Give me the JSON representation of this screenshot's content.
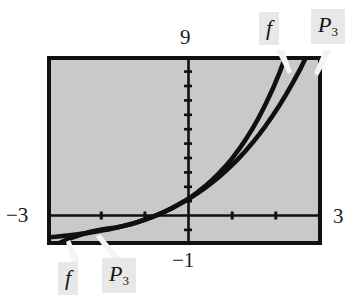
{
  "figure": {
    "type": "graphing-calculator-plot",
    "background_color": "#ffffff",
    "plot_fill_color": "#c9c9c9",
    "frame_color": "#111111",
    "curve_color": "#101010",
    "label_box_color": "#e8e8e8"
  },
  "axis_labels": {
    "y_max": "9",
    "y_min": "−3",
    "x_min": "−1",
    "x_max": "3"
  },
  "curve_labels": {
    "f_top": "f",
    "p3_top_base": "P",
    "p3_top_sub": "3",
    "f_bottom": "f",
    "p3_bottom_base": "P",
    "p3_bottom_sub": "3"
  },
  "chart_data": {
    "type": "line",
    "title": "",
    "subtitle": "",
    "xlabel": "",
    "ylabel": "",
    "xlim": [
      -1,
      3
    ],
    "ylim": [
      -3,
      9
    ],
    "grid": false,
    "legend": "inline-annotations",
    "x_ticks": [
      -1,
      0,
      1,
      2,
      3
    ],
    "y_ticks": [
      -3,
      -2,
      -1,
      0,
      1,
      2,
      3,
      4,
      5,
      6,
      7,
      8,
      9
    ],
    "x_tick_labels": [
      "−1",
      "",
      "",
      "",
      "3"
    ],
    "y_tick_labels": [
      "−3",
      "",
      "",
      "",
      "",
      "",
      "",
      "",
      "",
      "",
      "",
      "",
      "9"
    ],
    "annotations": [
      {
        "text": "f",
        "target_x": 2.72,
        "target_y": 9.0,
        "position": "top"
      },
      {
        "text": "P3",
        "target_x": 2.93,
        "target_y": 8.6,
        "position": "top"
      },
      {
        "text": "f",
        "target_x": -0.78,
        "target_y": -2.55,
        "position": "bottom"
      },
      {
        "text": "P3",
        "target_x": -0.42,
        "target_y": -2.1,
        "position": "bottom"
      }
    ],
    "series": [
      {
        "name": "f",
        "description": "exponential function f(x)",
        "x": [
          -1.0,
          -0.9,
          -0.8,
          -0.7,
          -0.6,
          -0.5,
          -0.4,
          -0.3,
          -0.2,
          -0.1,
          0.0,
          0.1,
          0.2,
          0.3,
          0.4,
          0.5,
          0.6,
          0.7,
          0.8,
          0.9,
          1.0,
          1.1,
          1.2,
          1.3,
          1.4,
          1.5,
          1.6,
          1.7,
          1.8,
          1.9,
          2.0,
          2.1,
          2.2,
          2.3,
          2.4,
          2.5,
          2.6,
          2.7,
          2.72
        ],
        "y": [
          -2.63,
          -2.59,
          -2.55,
          -2.5,
          -2.45,
          -2.39,
          -2.33,
          -2.26,
          -2.18,
          -2.1,
          -2.0,
          -1.89,
          -1.78,
          -1.65,
          -1.51,
          -1.35,
          -1.18,
          -0.99,
          -0.78,
          -0.54,
          -0.28,
          0.0,
          0.32,
          0.67,
          1.06,
          1.48,
          1.95,
          2.47,
          3.05,
          3.69,
          4.39,
          5.17,
          6.03,
          6.97,
          8.02,
          9.18,
          10.46,
          11.88,
          12.18
        ]
      },
      {
        "name": "P3",
        "description": "third-degree Taylor polynomial of f",
        "x": [
          -1.0,
          -0.9,
          -0.8,
          -0.7,
          -0.6,
          -0.5,
          -0.4,
          -0.3,
          -0.2,
          -0.1,
          0.0,
          0.1,
          0.2,
          0.3,
          0.4,
          0.5,
          0.6,
          0.7,
          0.8,
          0.9,
          1.0,
          1.1,
          1.2,
          1.3,
          1.4,
          1.5,
          1.6,
          1.7,
          1.8,
          1.9,
          2.0,
          2.1,
          2.2,
          2.3,
          2.4,
          2.5,
          2.6,
          2.7,
          2.9
        ],
        "y": [
          -3.33,
          -3.11,
          -2.91,
          -2.72,
          -2.56,
          -2.42,
          -2.29,
          -2.19,
          -2.11,
          -2.05,
          -2.0,
          -1.9,
          -1.79,
          -1.66,
          -1.51,
          -1.35,
          -1.17,
          -0.98,
          -0.77,
          -0.54,
          -0.3,
          -0.03,
          0.25,
          0.56,
          0.89,
          1.25,
          1.63,
          2.05,
          2.49,
          2.97,
          3.48,
          4.03,
          4.62,
          5.25,
          5.92,
          6.64,
          7.4,
          8.21,
          10.0
        ]
      }
    ]
  }
}
